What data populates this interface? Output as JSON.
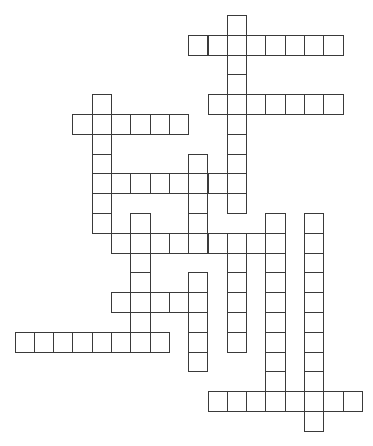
{
  "puzzle": {
    "type": "crossword",
    "background": "#ffffff",
    "line_color": "#3a3a3a",
    "grid": {
      "origin_x": 14.5,
      "origin_y": 15,
      "cell_w": 19.3,
      "cell_h": 19.8
    },
    "entries": [
      {
        "id": "A",
        "dir": "down",
        "col": 11,
        "row": 0,
        "length": 10
      },
      {
        "id": "B",
        "dir": "across",
        "col": 9,
        "row": 1,
        "length": 8
      },
      {
        "id": "C",
        "dir": "across",
        "col": 10,
        "row": 4,
        "length": 7
      },
      {
        "id": "D",
        "dir": "across",
        "col": 3,
        "row": 5,
        "length": 6
      },
      {
        "id": "E",
        "dir": "down",
        "col": 4,
        "row": 4,
        "length": 7
      },
      {
        "id": "F",
        "dir": "across",
        "col": 4,
        "row": 8,
        "length": 8
      },
      {
        "id": "G",
        "dir": "down",
        "col": 9,
        "row": 7,
        "length": 5
      },
      {
        "id": "J",
        "dir": "down",
        "col": 6,
        "row": 10,
        "length": 7
      },
      {
        "id": "K",
        "dir": "across",
        "col": 5,
        "row": 11,
        "length": 9
      },
      {
        "id": "L",
        "dir": "down",
        "col": 11,
        "row": 11,
        "length": 6
      },
      {
        "id": "M",
        "dir": "down",
        "col": 13,
        "row": 10,
        "length": 10
      },
      {
        "id": "N",
        "dir": "down",
        "col": 15,
        "row": 10,
        "length": 11
      },
      {
        "id": "H",
        "dir": "down",
        "col": 9,
        "row": 13,
        "length": 5
      },
      {
        "id": "I",
        "dir": "across",
        "col": 5,
        "row": 14,
        "length": 5
      },
      {
        "id": "P",
        "dir": "across",
        "col": 0,
        "row": 16,
        "length": 8
      },
      {
        "id": "O",
        "dir": "across",
        "col": 10,
        "row": 19,
        "length": 8
      }
    ]
  }
}
